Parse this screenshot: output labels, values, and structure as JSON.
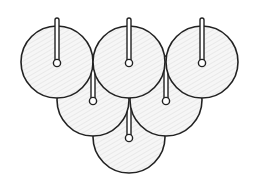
{
  "diagram": {
    "stroke_color": "#222222",
    "fill_color": "#f4f4f4",
    "hatch_color": "#d6d6d6",
    "radius": 36,
    "discs": [
      {
        "id": "top-left",
        "cx": 57,
        "cy": 62
      },
      {
        "id": "top-center",
        "cx": 129,
        "cy": 62
      },
      {
        "id": "top-right",
        "cx": 202,
        "cy": 62
      },
      {
        "id": "middle-left",
        "cx": 93,
        "cy": 100
      },
      {
        "id": "middle-right",
        "cx": 166,
        "cy": 100
      },
      {
        "id": "bottom-center",
        "cx": 129,
        "cy": 137
      }
    ]
  }
}
